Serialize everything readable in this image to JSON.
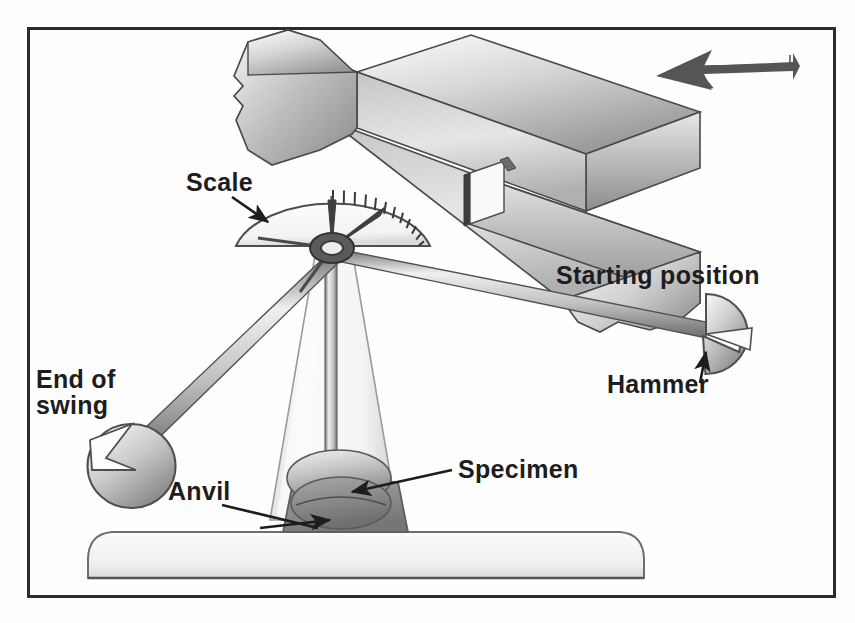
{
  "figure": {
    "border_color": "#2b2b2b",
    "background_color": "#fefefe"
  },
  "labels": {
    "scale": "Scale",
    "starting_position": "Starting position",
    "hammer": "Hammer",
    "end_of_swing_line1": "End of",
    "end_of_swing_line2": "swing",
    "specimen": "Specimen",
    "anvil": "Anvil"
  },
  "colors": {
    "outline": "#333333",
    "metal_light": "#f2f2f2",
    "metal_mid": "#c9c9c9",
    "metal_dark": "#8f8f8f",
    "anvil_gray": "#8a8a8a",
    "arrow_dark": "#555555",
    "text": "#1d1d1d"
  },
  "parts": {
    "specimen_illustration": {
      "name": "broken notched bar specimen",
      "impact_arrow_direction": "left"
    },
    "pendulum": {
      "pivot_x": 332,
      "pivot_y": 248,
      "starting_hammer_x": 706,
      "starting_hammer_y": 334,
      "end_hammer_x": 106,
      "end_hammer_y": 462,
      "scale_type": "protractor with graduations"
    },
    "base": {
      "name": "machine base plate"
    }
  }
}
